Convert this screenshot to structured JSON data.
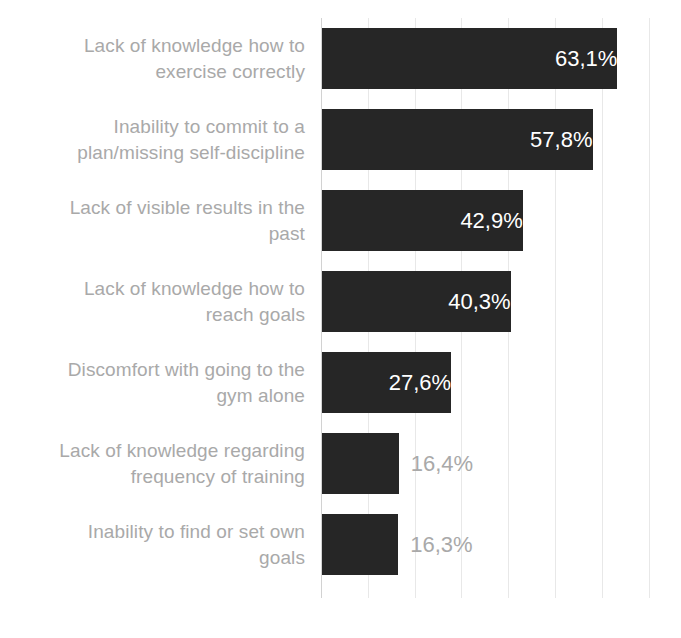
{
  "chart_data": {
    "type": "bar",
    "orientation": "horizontal",
    "title": "",
    "subtitle": "",
    "xlabel": "",
    "ylabel": "",
    "xlim": [
      0,
      70
    ],
    "grid": true,
    "gridlines_percent": [
      0,
      10,
      20,
      30,
      40,
      50,
      60,
      70
    ],
    "legend": "none",
    "value_suffix": "%",
    "decimal_separator": ",",
    "categories": [
      "Lack of knowledge how to exercise correctly",
      "Inability to commit to a plan/missing self-discipline",
      "Lack of visible results in the past",
      "Lack of knowledge how to reach goals",
      "Discomfort with going to the gym alone",
      "Lack of knowledge regarding frequency of training",
      "Inability to find or set own goals"
    ],
    "values": [
      63.1,
      57.8,
      42.9,
      40.3,
      27.6,
      16.4,
      16.3
    ],
    "value_labels": [
      "63,1%",
      "57,8%",
      "42,9%",
      "40,3%",
      "27,6%",
      "16,4%",
      "16,3%"
    ],
    "label_placement": [
      "inside",
      "inside",
      "inside",
      "inside",
      "inside",
      "outside",
      "outside"
    ],
    "colors": {
      "bar": "#262626",
      "value_inside": "#ffffff",
      "value_outside": "#a9a9a9",
      "category_label": "#a9a9a9",
      "gridline": "#e8e8e8",
      "axis": "#d2d2d2",
      "background": "#ffffff"
    }
  },
  "bars": [
    {
      "label_line1": "Lack of knowledge how to",
      "label_line2": "exercise correctly",
      "value_label": "63,1%"
    },
    {
      "label_line1": "Inability to commit to a",
      "label_line2": "plan/missing self-discipline",
      "value_label": "57,8%"
    },
    {
      "label_line1": "Lack of visible results in the",
      "label_line2": "past",
      "value_label": "42,9%"
    },
    {
      "label_line1": "Lack of knowledge how to",
      "label_line2": "reach goals",
      "value_label": "40,3%"
    },
    {
      "label_line1": "Discomfort with going to the",
      "label_line2": "gym alone",
      "value_label": "27,6%"
    },
    {
      "label_line1": "Lack of knowledge regarding",
      "label_line2": "frequency of training",
      "value_label": "16,4%"
    },
    {
      "label_line1": "Inability to find or set own",
      "label_line2": "goals",
      "value_label": "16,3%"
    }
  ]
}
